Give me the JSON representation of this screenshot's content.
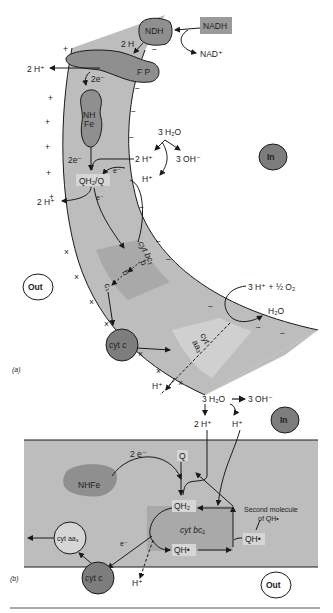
{
  "panel_a": {
    "label": "(a)",
    "nadh": "NADH",
    "nad": "NAD⁺",
    "ndh": "NDH",
    "two_h": "2 H",
    "fp": "F P",
    "two_h_plus_left": "2 H⁺",
    "two_e_top": "2e⁻",
    "nhfe_line1": "NH",
    "nhfe_line2": "Fe",
    "two_e_mid": "2e⁻",
    "water": "3 H₂O",
    "two_h_plus_center": "2 H⁺",
    "three_oh": "3 OH⁻",
    "h_plus_center": "H⁺",
    "e_minus_1": "e⁻",
    "qh2q": "QH₂/Q",
    "e_minus_2": "e⁻",
    "two_h_plus_lower": "2 H⁺",
    "cyt_bc1": "cyt bc₁",
    "b1": "b",
    "b2": "b",
    "c1": "c₁",
    "cyt_c": "cyt c",
    "cyt_aa3_line1": "cyt",
    "cyt_aa3_line2": "aa₃",
    "oxygen": "3 H⁺ + ½ O₂",
    "h2o": "H₂O",
    "h_plus_bottom": "H⁺",
    "in": "In",
    "out": "Out",
    "plus": "+",
    "minus": "−",
    "cross": "×"
  },
  "panel_b": {
    "label": "(b)",
    "water": "3 H₂O",
    "three_oh": "3 OH⁻",
    "two_h_plus": "2 H⁺",
    "h_plus": "H⁺",
    "in": "In",
    "out": "Out",
    "two_e": "2 e⁻",
    "q": "Q",
    "nhfe": "NHFe",
    "qh2": "QH₂",
    "cyt_bc1": "cyt bc₁",
    "qh_dot_lower": "QH•",
    "qh_dot_right": "QH•",
    "second_molecule_line1": "Second molecule",
    "second_molecule_line2": "of QH•",
    "cyt_aa3": "cyt aa₃",
    "e_minus": "e⁻",
    "cyt_c": "cyt c",
    "h_plus_bottom": "H⁺"
  },
  "colors": {
    "membrane": "#bdbdbd",
    "membrane_dark": "#a9a9a9",
    "membrane_light": "#cfcfcf",
    "protein": "#8f8f8f",
    "cyt_c": "#7d7d7d",
    "nadh_box": "#9a9a9a",
    "stroke": "#1a1a1a"
  }
}
